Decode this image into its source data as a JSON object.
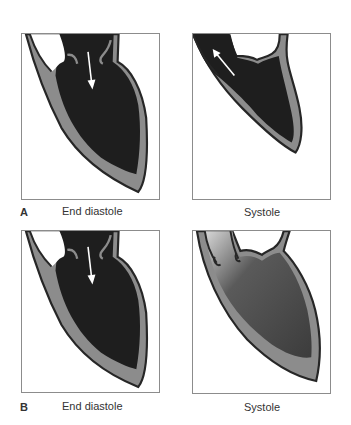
{
  "figure": {
    "rows": [
      {
        "letter": "A",
        "panels": [
          {
            "caption": "End diastole",
            "phase": "diastole",
            "flow_arrow": "down-into-ventricle"
          },
          {
            "caption": "Systole",
            "phase": "systole",
            "flow_arrow": "up-out-through-aorta"
          }
        ]
      },
      {
        "letter": "B",
        "panels": [
          {
            "caption": "End diastole",
            "phase": "diastole",
            "flow_arrow": "down-into-ventricle"
          },
          {
            "caption": "Systole",
            "phase": "systole",
            "flow_arrow": "none"
          }
        ]
      }
    ]
  },
  "colors": {
    "chamber_dark": "#1e1e1e",
    "chamber_systole_b": "#4a4a4a",
    "wall_gray": "#8c8c8c",
    "outline": "#262626",
    "box_border": "#8c8c8c",
    "arrow": "#ffffff"
  }
}
